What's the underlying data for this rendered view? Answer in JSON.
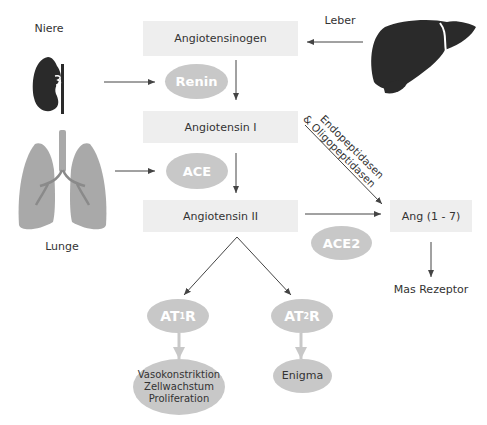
{
  "organs": {
    "kidney": {
      "label": "Niere",
      "icon": "kidney-icon"
    },
    "liver": {
      "label": "Leber",
      "icon": "liver-icon"
    },
    "lung": {
      "label": "Lunge",
      "icon": "lungs-icon"
    }
  },
  "substrates": {
    "angiotensinogen": "Angiotensinogen",
    "angiotensin_1": "Angiotensin I",
    "angiotensin_2": "Angiotensin II",
    "ang_1_7": "Ang (1 - 7)"
  },
  "enzymes": {
    "renin": "Renin",
    "ace": "ACE",
    "ace2": "ACE2",
    "peptidases_line1": "Endopeptidasen",
    "peptidases_line2": "& Oligopeptidasen"
  },
  "receptors": {
    "at1r": {
      "prefix": "AT",
      "sub": "1",
      "suffix": "R"
    },
    "at2r": {
      "prefix": "AT",
      "sub": "2",
      "suffix": "R"
    },
    "mas": "Mas Rezeptor"
  },
  "effects": {
    "at1r_line1": "Vasokonstriktion",
    "at1r_line2": "Zellwachstum",
    "at1r_line3": "Proliferation",
    "at2r": "Enigma"
  },
  "colors": {
    "box": "#eeeeee",
    "ellipse": "#c8c8c8",
    "organ_dark": "#2a2a2a",
    "lung": "#a9a9a9",
    "arrow": "#444444"
  }
}
